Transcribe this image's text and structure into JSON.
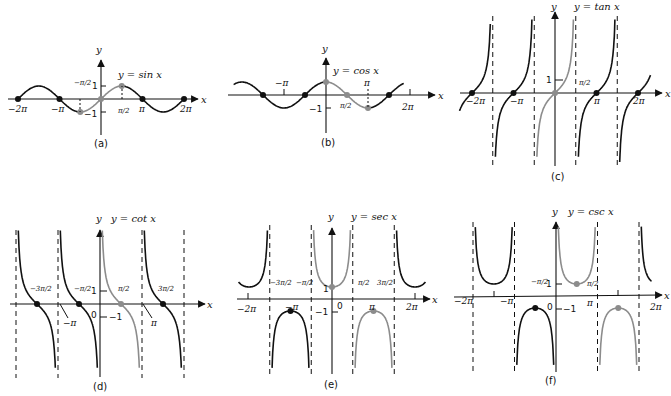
{
  "figure": {
    "panels": [
      {
        "id": "a",
        "caption": "(a)",
        "title": "y = sin x",
        "y_label": "y",
        "x_label": "x",
        "function": "sin",
        "x_ticks": [
          "−2π",
          "−π",
          "−π/2",
          "π/2",
          "π",
          "2π"
        ],
        "y_ticks": [
          "1",
          "−1"
        ]
      },
      {
        "id": "b",
        "caption": "(b)",
        "title": "y = cos x",
        "y_label": "y",
        "x_label": "x",
        "function": "cos",
        "x_ticks": [
          "−π",
          "π/2",
          "π",
          "2π"
        ],
        "y_ticks": [
          "−1"
        ]
      },
      {
        "id": "c",
        "caption": "(c)",
        "title": "y = tan x",
        "y_label": "y",
        "x_label": "x",
        "function": "tan",
        "x_ticks": [
          "−2π",
          "−π",
          "π/2",
          "π",
          "2π"
        ],
        "y_ticks": [
          "1"
        ]
      },
      {
        "id": "d",
        "caption": "(d)",
        "title": "y = cot x",
        "y_label": "y",
        "x_label": "x",
        "function": "cot",
        "x_ticks": [
          "−3π/2",
          "−π",
          "−π/2",
          "0",
          "π/2",
          "π",
          "3π/2"
        ],
        "y_ticks": [
          "1",
          "−1"
        ]
      },
      {
        "id": "e",
        "caption": "(e)",
        "title": "y = sec x",
        "y_label": "y",
        "x_label": "x",
        "function": "sec",
        "x_ticks": [
          "−2π",
          "−3π/2",
          "−π",
          "−π/2",
          "0",
          "π/2",
          "π",
          "3π/2",
          "2π"
        ],
        "y_ticks": [
          "1",
          "−1"
        ]
      },
      {
        "id": "f",
        "caption": "(f)",
        "title": "y = csc x",
        "y_label": "y",
        "x_label": "x",
        "function": "csc",
        "x_ticks": [
          "−2π",
          "−π",
          "−π/2",
          "0",
          "π/2",
          "π",
          "2π"
        ],
        "y_ticks": [
          "1",
          "−1"
        ]
      }
    ],
    "colors": {
      "dark": "#111111",
      "highlight": "#8c8c8c",
      "background": "#ffffff"
    }
  }
}
